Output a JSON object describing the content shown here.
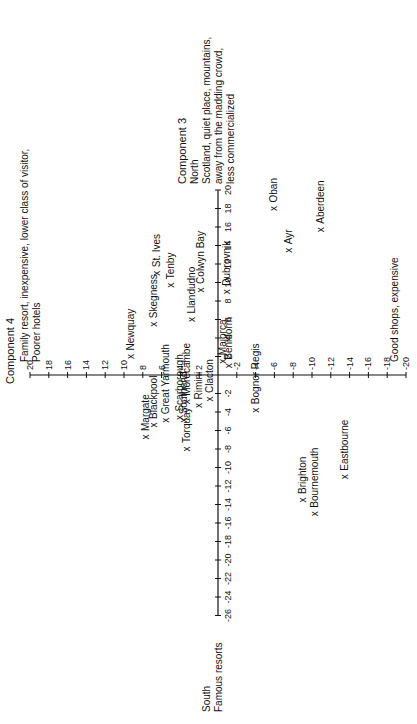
{
  "chart_data": {
    "type": "scatter",
    "title": "",
    "xlabel": "Component 3",
    "ylabel": "Component 4",
    "x_axis": {
      "range": [
        -26,
        20
      ],
      "ticks": [
        -26,
        -24,
        -22,
        -20,
        -18,
        -16,
        -14,
        -12,
        -10,
        -8,
        -6,
        -4,
        -2,
        2,
        4,
        6,
        8,
        10,
        12,
        14,
        16,
        18,
        20
      ],
      "positive_end_label": [
        "Component 3",
        "North",
        "Scotland, quiet place, mountains,",
        "away from the madding crowd,",
        "less commercialized"
      ],
      "negative_end_label": [
        "South",
        "Famous resorts"
      ]
    },
    "y_axis": {
      "range": [
        -20,
        20
      ],
      "ticks": [
        -20,
        -18,
        -16,
        -14,
        -12,
        -10,
        -8,
        -6,
        -4,
        -2,
        2,
        4,
        6,
        8,
        10,
        12,
        14,
        16,
        18,
        20
      ],
      "positive_end_label": [
        "Component 4",
        "Family resort, inexpensive, lower class of visitor,",
        "Poorer hotels"
      ],
      "negative_end_label": [
        "Good shops, expensive"
      ]
    },
    "grid": false,
    "rotation_deg": -90,
    "points": [
      {
        "name": "Oban",
        "x": 18,
        "y": -6
      },
      {
        "name": "Aberdeen",
        "x": 15.7,
        "y": -11
      },
      {
        "name": "Ayr",
        "x": 13.5,
        "y": -7.5
      },
      {
        "name": "Dubrovnik",
        "x": 9,
        "y": -1
      },
      {
        "name": "Colwyn Bay",
        "x": 9.2,
        "y": 1.8
      },
      {
        "name": "Tenby",
        "x": 9.7,
        "y": 5
      },
      {
        "name": "Llandudno",
        "x": 6,
        "y": 2.8
      },
      {
        "name": "St. Ives",
        "x": 11,
        "y": 6.5
      },
      {
        "name": "Skegness",
        "x": 5.5,
        "y": 6.8
      },
      {
        "name": "Newquay",
        "x": 2,
        "y": 9.3
      },
      {
        "name": "Majorca",
        "x": 1.5,
        "y": -0.5
      },
      {
        "name": "Benidorm",
        "x": 1,
        "y": -1.2
      },
      {
        "name": "Clacton",
        "x": -2.6,
        "y": 0.9
      },
      {
        "name": "Rimini",
        "x": -3.3,
        "y": 2
      },
      {
        "name": "Morecambe",
        "x": -2.9,
        "y": 3.3
      },
      {
        "name": "Scarborough",
        "x": -4.6,
        "y": 4
      },
      {
        "name": "Southend",
        "x": -4.9,
        "y": 3.6
      },
      {
        "name": "Great Yarmouth",
        "x": -4.9,
        "y": 5.5
      },
      {
        "name": "Blackpool",
        "x": -5.4,
        "y": 6.8
      },
      {
        "name": "Margate",
        "x": -6.7,
        "y": 7.7
      },
      {
        "name": "Torquay",
        "x": -8,
        "y": 3.3
      },
      {
        "name": "Bognor Regis",
        "x": -3.8,
        "y": -4
      },
      {
        "name": "Brighton",
        "x": -13.5,
        "y": -9
      },
      {
        "name": "Bournemouth",
        "x": -15,
        "y": -10.3
      },
      {
        "name": "Eastbourne",
        "x": -11,
        "y": -13.5
      }
    ]
  },
  "labels": {
    "comp4": "Component 4",
    "comp4_pos_1": "Family resort, inexpensive, lower class of visitor,",
    "comp4_pos_2": "Poorer hotels",
    "comp4_neg": "Good shops, expensive",
    "comp3": "Component 3",
    "comp3_north": "North",
    "comp3_pos_1": "Scotland, quiet place, mountains,",
    "comp3_pos_2": "away from the madding crowd,",
    "comp3_pos_3": "less commercialized",
    "comp3_south": "South",
    "comp3_neg": "Famous resorts"
  }
}
